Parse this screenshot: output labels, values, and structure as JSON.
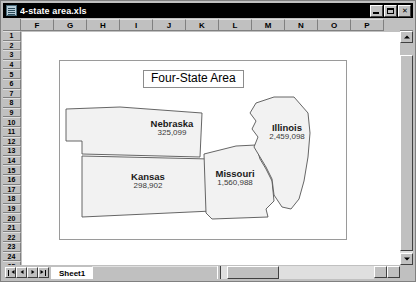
{
  "window": {
    "title": "4-state area.xls",
    "icon": "excel-workbook-icon",
    "buttons": [
      {
        "name": "minimize-button",
        "label": "_"
      },
      {
        "name": "maximize-button",
        "label": "□"
      },
      {
        "name": "close-button",
        "label": "✕"
      }
    ]
  },
  "spreadsheet": {
    "column_headers": [
      "F",
      "G",
      "H",
      "I",
      "J",
      "K",
      "L",
      "M",
      "N",
      "O",
      "P"
    ],
    "row_headers": [
      "1",
      "2",
      "3",
      "4",
      "5",
      "6",
      "7",
      "8",
      "9",
      "10",
      "11",
      "12",
      "13",
      "14",
      "15",
      "16",
      "17",
      "18",
      "19",
      "20",
      "21",
      "22",
      "23",
      "24",
      "25"
    ],
    "sheet_tabs": [
      "Sheet1"
    ],
    "active_sheet": "Sheet1",
    "tab_nav": [
      "first-sheet",
      "previous-sheet",
      "next-sheet",
      "last-sheet"
    ]
  },
  "chart_data": {
    "type": "map",
    "title": "Four-State Area",
    "xlabel": "",
    "ylabel": "",
    "grid": false,
    "legend": "none",
    "categories": [
      "Nebraska",
      "Kansas",
      "Missouri",
      "Illinois"
    ],
    "values": [
      325099,
      298902,
      1560988,
      2459098
    ],
    "value_labels": [
      "325,099",
      "298,902",
      "1,560,988",
      "2,459,098"
    ],
    "regions": [
      {
        "name": "Nebraska",
        "value": 325099,
        "value_label": "325,099"
      },
      {
        "name": "Kansas",
        "value": 298902,
        "value_label": "298,902"
      },
      {
        "name": "Missouri",
        "value": 1560988,
        "value_label": "1,560,988"
      },
      {
        "name": "Illinois",
        "value": 2459098,
        "value_label": "2,459,098"
      }
    ],
    "colors": {
      "region_fill": "#f2f2f2",
      "region_stroke": "#555555",
      "plot_background": "#ffffff",
      "title_border": "#8c8c8c"
    }
  }
}
